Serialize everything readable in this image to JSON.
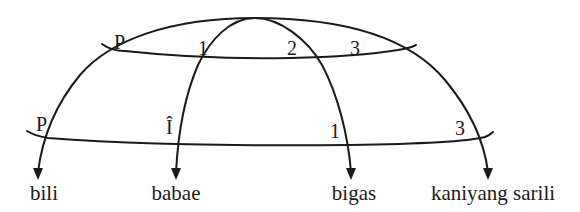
{
  "diagram": {
    "stroke_color": "#1a1a1a",
    "background": "#ffffff",
    "upper_track": {
      "labels": [
        "P",
        "1",
        "2",
        "3"
      ]
    },
    "lower_track": {
      "labels": [
        "P",
        "Î",
        "1",
        "3"
      ]
    },
    "targets": [
      {
        "label": "bili"
      },
      {
        "label": "babae"
      },
      {
        "label": "bigas"
      },
      {
        "label": "kaniyang sarili"
      }
    ],
    "icons": [
      "arrowhead-icon",
      "arrowhead-icon",
      "arrowhead-icon",
      "arrowhead-icon"
    ]
  }
}
